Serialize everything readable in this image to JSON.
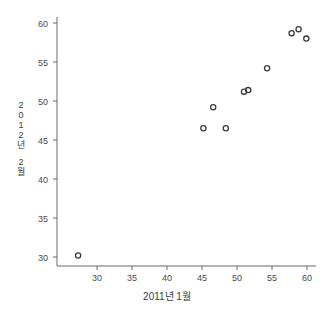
{
  "chart_data": {
    "type": "scatter",
    "title": "",
    "xlabel": "2011년 1월",
    "ylabel": "2012년 2월",
    "xlim": [
      26.5,
      61.5
    ],
    "ylim": [
      28.5,
      61.0
    ],
    "xticks": [
      30,
      35,
      40,
      45,
      50,
      55,
      60
    ],
    "yticks": [
      30,
      35,
      40,
      45,
      50,
      55,
      60
    ],
    "xtick_labels": [
      "30",
      "35",
      "40",
      "45",
      "50",
      "55",
      "60"
    ],
    "ytick_labels": [
      "30",
      "35",
      "40",
      "45",
      "50",
      "55",
      "60"
    ],
    "grid": false,
    "legend": null,
    "marker": "open-circle",
    "marker_color": "#3c3c3c",
    "marker_size": 4,
    "points": [
      {
        "x": 27.3,
        "y": 30.2
      },
      {
        "x": 45.2,
        "y": 46.5
      },
      {
        "x": 46.6,
        "y": 49.2
      },
      {
        "x": 48.4,
        "y": 46.5
      },
      {
        "x": 51.0,
        "y": 51.2
      },
      {
        "x": 51.6,
        "y": 51.4
      },
      {
        "x": 54.3,
        "y": 54.2
      },
      {
        "x": 57.8,
        "y": 58.7
      },
      {
        "x": 58.8,
        "y": 59.2
      },
      {
        "x": 59.9,
        "y": 58.0
      }
    ]
  },
  "axis": {
    "ylabel_chars": [
      "2",
      "0",
      "1",
      "2",
      "년"
    ],
    "ylabel_chars2": [
      "2",
      "월"
    ]
  },
  "colors": {
    "axis": "#6b6b6b",
    "marker": "#3c3c3c",
    "text": "#3a3a3a",
    "background": "#ffffff"
  }
}
